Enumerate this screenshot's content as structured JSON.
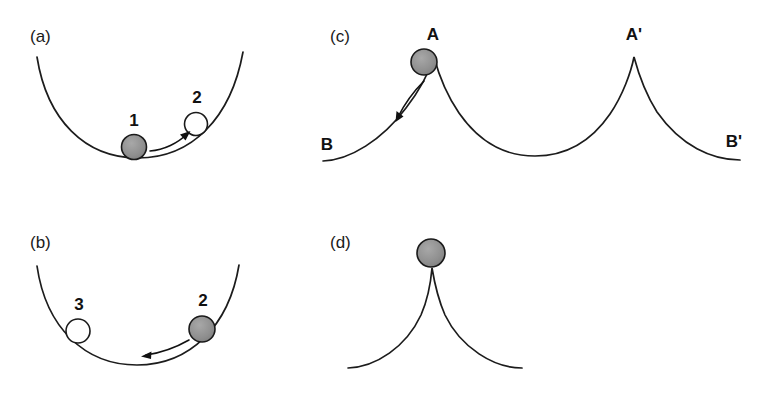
{
  "figure": {
    "width": 771,
    "height": 393,
    "background_color": "#ffffff",
    "line_color": "#1c1c1c",
    "ball_fill_color": "#8f8f8f",
    "ball_open_color": "#ffffff",
    "text_color": "#111111"
  },
  "panels": [
    {
      "id": "a",
      "label": "(a)",
      "label_x": 30,
      "label_y": 42,
      "description": "concave bowl with ball at bottom moving right",
      "track": {
        "type": "bowl",
        "path": "M 37 57 C 47 120 85 158 138 158 C 192 158 231 118 243 52"
      },
      "balls": [
        {
          "number": "1",
          "style": "filled",
          "cx": 134,
          "cy": 147,
          "r": 12.5,
          "label_x": 134,
          "label_y": 126
        },
        {
          "number": "2",
          "style": "open",
          "cx": 196,
          "cy": 124,
          "r": 11.5,
          "label_x": 197,
          "label_y": 103
        }
      ],
      "arrows": [
        {
          "direction": "right",
          "path": "M 150 151 C 164 150 178 143 187 134",
          "head": "189 132 181 133 185 140"
        }
      ]
    },
    {
      "id": "b",
      "label": "(b)",
      "label_x": 30,
      "label_y": 248,
      "description": "concave bowl with ball on right slope moving left",
      "track": {
        "type": "bowl",
        "path": "M 37 266 C 46 328 85 365 137 365 C 190 365 229 326 239 265"
      },
      "balls": [
        {
          "number": "3",
          "style": "open",
          "cx": 78,
          "cy": 331,
          "r": 12,
          "label_x": 79,
          "label_y": 310
        },
        {
          "number": "2",
          "style": "filled",
          "cx": 202,
          "cy": 329,
          "r": 13,
          "label_x": 203,
          "label_y": 306
        }
      ],
      "arrows": [
        {
          "direction": "left",
          "path": "M 189 340 C 175 348 160 353 146 355",
          "head": "142 356 150 352 150 359"
        }
      ]
    },
    {
      "id": "c",
      "label": "(c)",
      "label_x": 330,
      "label_y": 42,
      "description": "cycloid track with two cusps A and A' and flat ends B and B'",
      "track": {
        "type": "cycloid-two-cusps",
        "path": "M 323 161 C 350 160 382 140 406 108 C 420 90 429 72 434 57 C 438 72 446 94 459 113 C 482 146 508 156 535 156 C 562 156 588 146 610 114 C 623 95 631 72 634 57 C 638 72 645 93 657 112 C 681 146 712 160 740 160"
      },
      "balls": [
        {
          "number": "",
          "style": "filled",
          "cx": 424,
          "cy": 62,
          "r": 13,
          "label_x": 0,
          "label_y": 0
        }
      ],
      "arrows": [
        {
          "direction": "down-left",
          "path": "M 424 81 C 415 90 405 103 398 117",
          "head": "396 121 396 112 403 116"
        }
      ],
      "point_labels": [
        {
          "text": "A",
          "x": 433,
          "y": 40
        },
        {
          "text": "A'",
          "x": 634,
          "y": 40
        },
        {
          "text": "B",
          "x": 327,
          "y": 150
        },
        {
          "text": "B'",
          "x": 734,
          "y": 147
        }
      ]
    },
    {
      "id": "d",
      "label": "(d)",
      "label_x": 330,
      "label_y": 248,
      "description": "single cycloid cusp with ball balanced at the apex",
      "track": {
        "type": "cycloid-one-cusp",
        "path": "M 348 368 C 376 367 406 347 421 315 C 428 299 431 280 432 268 C 434 280 438 299 445 315 C 461 348 494 368 522 368"
      },
      "balls": [
        {
          "number": "",
          "style": "filled",
          "cx": 431,
          "cy": 253,
          "r": 14,
          "label_x": 0,
          "label_y": 0
        }
      ],
      "arrows": [],
      "point_labels": []
    }
  ]
}
